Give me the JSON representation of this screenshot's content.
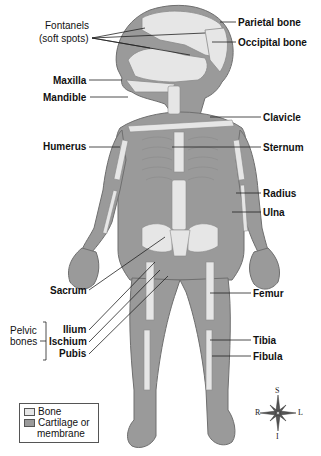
{
  "figure": {
    "colors": {
      "bone": "#e6e6e6",
      "cartilage": "#9a9a9a",
      "outline": "#6f6f6f",
      "leader": "#222222"
    }
  },
  "labels": {
    "fontanels_line1": "Fontanels",
    "fontanels_line2": "(soft spots)",
    "maxilla": "Maxilla",
    "mandible": "Mandible",
    "humerus": "Humerus",
    "sacrum": "Sacrum",
    "pelvic_line1": "Pelvic",
    "pelvic_line2": "bones",
    "ilium": "Ilium",
    "ischium": "Ischium",
    "pubis": "Pubis",
    "parietal": "Parietal bone",
    "occipital": "Occipital bone",
    "clavicle": "Clavicle",
    "sternum": "Sternum",
    "radius": "Radius",
    "ulna": "Ulna",
    "femur": "Femur",
    "tibia": "Tibia",
    "fibula": "Fibula"
  },
  "legend": {
    "items": [
      {
        "label": "Bone",
        "color": "#e6e6e6"
      },
      {
        "label_line1": "Cartilage or",
        "label_line2": "membrane",
        "color": "#9a9a9a"
      }
    ]
  },
  "compass": {
    "top": "S",
    "bottom": "I",
    "left": "R",
    "right": "L"
  }
}
